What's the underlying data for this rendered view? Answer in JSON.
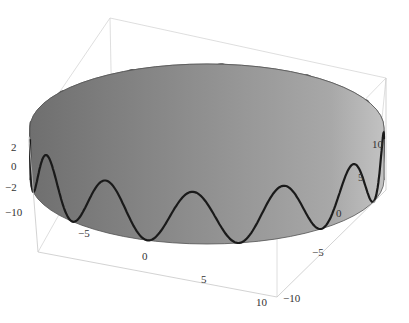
{
  "chart_data": {
    "type": "3d-parametric-surface",
    "title": "",
    "surface": {
      "shape": "cylinder",
      "radius": 10,
      "z_range": [
        -2,
        2
      ],
      "colors": {
        "outer_front": "#8c8c8c",
        "outer_light": "#b4b4b4",
        "inner_back": "#b9b9b9",
        "top_opening": "#d8d8d8"
      }
    },
    "curve": {
      "equation": "x=10cos t, y=10sin t, z=2 sin(n t)",
      "amplitude": 2,
      "oscillations_per_revolution": 12,
      "color_front": "#1a1a1a",
      "color_back": "#555555"
    },
    "axes": {
      "x": {
        "range": [
          -10,
          10
        ],
        "ticks": [
          "-5",
          "0",
          "5",
          "10"
        ]
      },
      "y": {
        "range": [
          -10,
          10
        ],
        "ticks": [
          "-10",
          "-5",
          "0",
          "5",
          "10"
        ]
      },
      "z": {
        "range": [
          -2,
          2
        ],
        "ticks": [
          "2",
          "0",
          "-2"
        ]
      },
      "left_corner_tick": "-10"
    },
    "box": {
      "visible": true,
      "color": "#d0d0d0"
    }
  }
}
